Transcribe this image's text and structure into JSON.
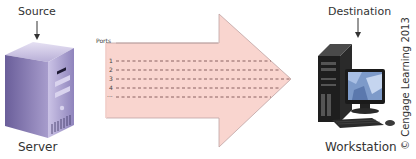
{
  "source": {
    "label": "Source",
    "device_label": "Server",
    "icon": "server-tower-icon"
  },
  "destination": {
    "label": "Destination",
    "device_label": "Workstation",
    "icon": "desktop-workstation-icon"
  },
  "arrow": {
    "ports_label": "Ports",
    "port_numbers": [
      "1",
      "2",
      "3",
      "4",
      "..."
    ],
    "fill_color": "#f9d5cf",
    "border_color": "#b9a0a0",
    "dash_color": "#8a5a5a"
  },
  "copyright": "© Cengage Learning 2013"
}
